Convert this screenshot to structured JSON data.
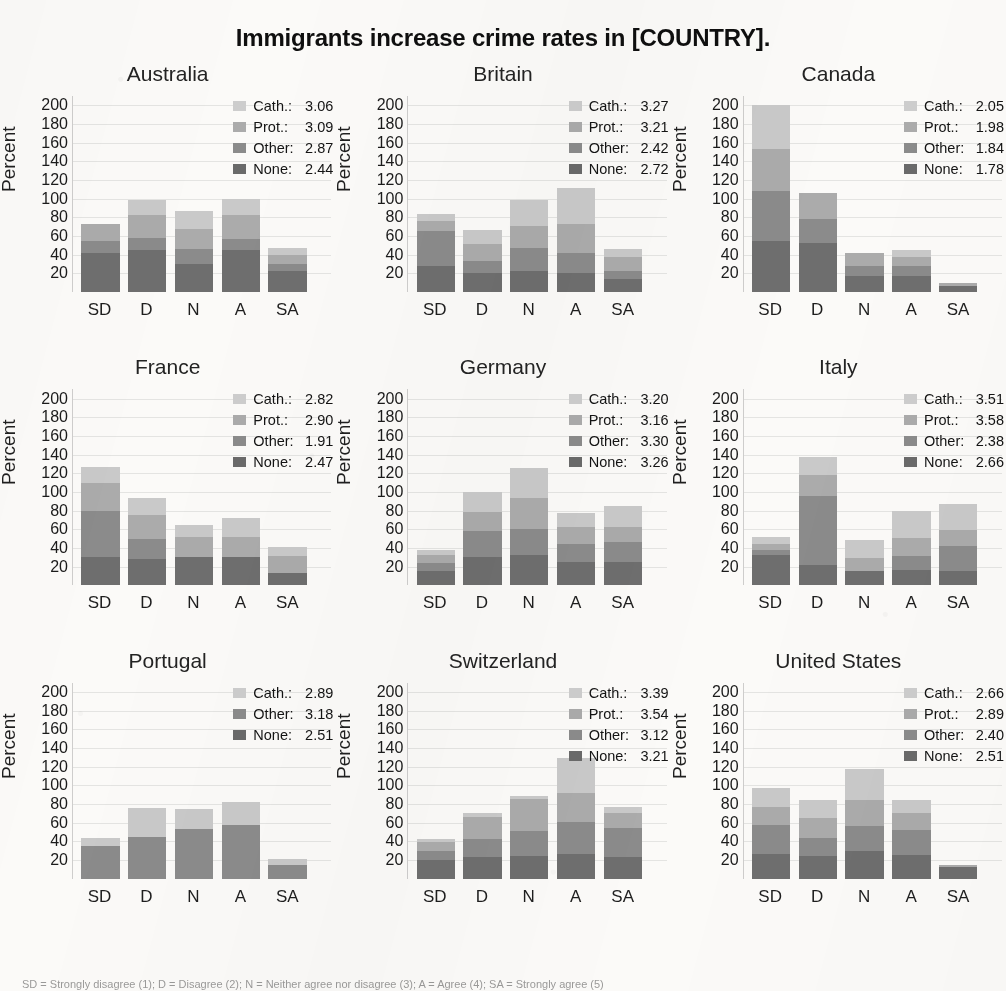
{
  "figure": {
    "title": "Immigrants increase crime rates in [COUNTRY].",
    "y_axis_label": "Percent",
    "caption": "SD = Strongly disagree (1); D = Disagree (2); N = Neither agree nor disagree (3); A = Agree (4); SA = Strongly agree (5)"
  },
  "series_labels": {
    "cath": "Cath.:",
    "prot": "Prot.:",
    "other": "Other:",
    "none": "None:"
  },
  "colors": {
    "cath": "#c9c9c9",
    "prot": "#ababab",
    "other": "#8b8b8b",
    "none": "#6e6e6e",
    "title": "#0f0f0f",
    "background": "#fbfaf8"
  },
  "chart_data": {
    "type": "bar",
    "subtype": "stacked-bar-small-multiples",
    "title": "Immigrants increase crime rates in [COUNTRY].",
    "xlabel": "",
    "ylabel": "Percent",
    "ylim": [
      0,
      210
    ],
    "yticks": [
      20,
      40,
      60,
      80,
      100,
      120,
      140,
      160,
      180,
      200
    ],
    "grid": true,
    "legend_position": "top-right inside each panel",
    "categories": [
      "SD",
      "D",
      "N",
      "A",
      "SA"
    ],
    "category_full": [
      "Strongly disagree",
      "Disagree",
      "Neither agree nor disagree",
      "Agree",
      "Strongly agree"
    ],
    "series_order": [
      "none",
      "other",
      "prot",
      "cath"
    ],
    "series_names": [
      "None",
      "Other",
      "Prot.",
      "Cath."
    ],
    "panels": [
      {
        "name": "Australia",
        "legend": [
          {
            "key": "cath",
            "label": "Cath.:",
            "value": "3.06"
          },
          {
            "key": "prot",
            "label": "Prot.:",
            "value": "3.09"
          },
          {
            "key": "other",
            "label": "Other:",
            "value": "2.87"
          },
          {
            "key": "none",
            "label": "None:",
            "value": "2.44"
          }
        ],
        "series": [
          {
            "name": "None",
            "key": "none",
            "values": [
              42,
              45,
              30,
              45,
              22
            ]
          },
          {
            "name": "Other",
            "key": "other",
            "values": [
              13,
              13,
              16,
              12,
              8
            ]
          },
          {
            "name": "Prot.",
            "key": "prot",
            "values": [
              18,
              25,
              22,
              26,
              10
            ]
          },
          {
            "name": "Cath.",
            "key": "cath",
            "values": [
              0,
              16,
              19,
              17,
              7
            ]
          }
        ],
        "totals": [
          73,
          99,
          87,
          100,
          47
        ]
      },
      {
        "name": "Britain",
        "legend": [
          {
            "key": "cath",
            "label": "Cath.:",
            "value": "3.27"
          },
          {
            "key": "prot",
            "label": "Prot.:",
            "value": "3.21"
          },
          {
            "key": "other",
            "label": "Other:",
            "value": "2.42"
          },
          {
            "key": "none",
            "label": "None:",
            "value": "2.72"
          }
        ],
        "series": [
          {
            "name": "None",
            "key": "none",
            "values": [
              28,
              20,
              22,
              20,
              14
            ]
          },
          {
            "name": "Other",
            "key": "other",
            "values": [
              37,
              13,
              25,
              22,
              8
            ]
          },
          {
            "name": "Prot.",
            "key": "prot",
            "values": [
              11,
              19,
              24,
              31,
              16
            ]
          },
          {
            "name": "Cath.",
            "key": "cath",
            "values": [
              8,
              14,
              28,
              39,
              8
            ]
          }
        ],
        "totals": [
          84,
          66,
          99,
          112,
          46
        ]
      },
      {
        "name": "Canada",
        "legend": [
          {
            "key": "cath",
            "label": "Cath.:",
            "value": "2.05"
          },
          {
            "key": "prot",
            "label": "Prot.:",
            "value": "1.98"
          },
          {
            "key": "other",
            "label": "Other:",
            "value": "1.84"
          },
          {
            "key": "none",
            "label": "None:",
            "value": "1.78"
          }
        ],
        "series": [
          {
            "name": "None",
            "key": "none",
            "values": [
              55,
              53,
              17,
              17,
              6
            ]
          },
          {
            "name": "Other",
            "key": "other",
            "values": [
              53,
              25,
              11,
              11,
              0
            ]
          },
          {
            "name": "Prot.",
            "key": "prot",
            "values": [
              45,
              28,
              14,
              9,
              4
            ]
          },
          {
            "name": "Cath.",
            "key": "cath",
            "values": [
              47,
              0,
              0,
              8,
              0
            ]
          }
        ],
        "totals": [
          200,
          106,
          42,
          45,
          10
        ]
      },
      {
        "name": "France",
        "legend": [
          {
            "key": "cath",
            "label": "Cath.:",
            "value": "2.82"
          },
          {
            "key": "prot",
            "label": "Prot.:",
            "value": "2.90"
          },
          {
            "key": "other",
            "label": "Other:",
            "value": "1.91"
          },
          {
            "key": "none",
            "label": "None:",
            "value": "2.47"
          }
        ],
        "series": [
          {
            "name": "None",
            "key": "none",
            "values": [
              30,
              28,
              30,
              30,
              13
            ]
          },
          {
            "name": "Other",
            "key": "other",
            "values": [
              50,
              22,
              0,
              0,
              0
            ]
          },
          {
            "name": "Prot.",
            "key": "prot",
            "values": [
              30,
              25,
              22,
              22,
              18
            ]
          },
          {
            "name": "Cath.",
            "key": "cath",
            "values": [
              17,
              19,
              13,
              20,
              10
            ]
          }
        ],
        "totals": [
          127,
          94,
          65,
          72,
          41
        ]
      },
      {
        "name": "Germany",
        "legend": [
          {
            "key": "cath",
            "label": "Cath.:",
            "value": "3.20"
          },
          {
            "key": "prot",
            "label": "Prot.:",
            "value": "3.16"
          },
          {
            "key": "other",
            "label": "Other:",
            "value": "3.30"
          },
          {
            "key": "none",
            "label": "None:",
            "value": "3.26"
          }
        ],
        "series": [
          {
            "name": "None",
            "key": "none",
            "values": [
              15,
              30,
              32,
              25,
              25
            ]
          },
          {
            "name": "Other",
            "key": "other",
            "values": [
              9,
              28,
              28,
              19,
              21
            ]
          },
          {
            "name": "Prot.",
            "key": "prot",
            "values": [
              8,
              21,
              34,
              18,
              17
            ]
          },
          {
            "name": "Cath.",
            "key": "cath",
            "values": [
              6,
              21,
              32,
              16,
              22
            ]
          }
        ],
        "totals": [
          38,
          100,
          126,
          78,
          85
        ]
      },
      {
        "name": "Italy",
        "legend": [
          {
            "key": "cath",
            "label": "Cath.:",
            "value": "3.51"
          },
          {
            "key": "prot",
            "label": "Prot.:",
            "value": "3.58"
          },
          {
            "key": "other",
            "label": "Other:",
            "value": "2.38"
          },
          {
            "key": "none",
            "label": "None:",
            "value": "2.66"
          }
        ],
        "series": [
          {
            "name": "None",
            "key": "none",
            "values": [
              33,
              22,
              15,
              16,
              15
            ]
          },
          {
            "name": "Other",
            "key": "other",
            "values": [
              5,
              74,
              0,
              15,
              27
            ]
          },
          {
            "name": "Prot.",
            "key": "prot",
            "values": [
              6,
              22,
              14,
              20,
              17
            ]
          },
          {
            "name": "Cath.",
            "key": "cath",
            "values": [
              8,
              19,
              20,
              29,
              28
            ]
          }
        ],
        "totals": [
          52,
          137,
          49,
          80,
          87
        ]
      },
      {
        "name": "Portugal",
        "legend": [
          {
            "key": "cath",
            "label": "Cath.:",
            "value": "2.89"
          },
          {
            "key": "other",
            "label": "Other:",
            "value": "3.18"
          },
          {
            "key": "none",
            "label": "None:",
            "value": "2.51"
          }
        ],
        "series": [
          {
            "name": "None",
            "key": "none",
            "values": [
              0,
              0,
              0,
              0,
              0
            ]
          },
          {
            "name": "Other",
            "key": "other",
            "values": [
              35,
              45,
              53,
              57,
              15
            ]
          },
          {
            "name": "Prot.",
            "key": "prot",
            "values": [
              0,
              0,
              0,
              0,
              0
            ]
          },
          {
            "name": "Cath.",
            "key": "cath",
            "values": [
              9,
              31,
              22,
              25,
              6
            ]
          }
        ],
        "totals": [
          44,
          76,
          75,
          82,
          21
        ]
      },
      {
        "name": "Switzerland",
        "legend": [
          {
            "key": "cath",
            "label": "Cath.:",
            "value": "3.39"
          },
          {
            "key": "prot",
            "label": "Prot.:",
            "value": "3.54"
          },
          {
            "key": "other",
            "label": "Other:",
            "value": "3.12"
          },
          {
            "key": "none",
            "label": "None:",
            "value": "3.21"
          }
        ],
        "series": [
          {
            "name": "None",
            "key": "none",
            "values": [
              20,
              23,
              24,
              26,
              23
            ]
          },
          {
            "name": "Other",
            "key": "other",
            "values": [
              10,
              20,
              27,
              35,
              31
            ]
          },
          {
            "name": "Prot.",
            "key": "prot",
            "values": [
              9,
              23,
              34,
              31,
              16
            ]
          },
          {
            "name": "Cath.",
            "key": "cath",
            "values": [
              3,
              4,
              4,
              37,
              7
            ]
          }
        ],
        "totals": [
          42,
          70,
          89,
          129,
          77
        ]
      },
      {
        "name": "United States",
        "legend": [
          {
            "key": "cath",
            "label": "Cath.:",
            "value": "2.66"
          },
          {
            "key": "prot",
            "label": "Prot.:",
            "value": "2.89"
          },
          {
            "key": "other",
            "label": "Other:",
            "value": "2.40"
          },
          {
            "key": "none",
            "label": "None:",
            "value": "2.51"
          }
        ],
        "series": [
          {
            "name": "None",
            "key": "none",
            "values": [
              26,
              24,
              30,
              25,
              13
            ]
          },
          {
            "name": "Other",
            "key": "other",
            "values": [
              32,
              20,
              26,
              27,
              0
            ]
          },
          {
            "name": "Prot.",
            "key": "prot",
            "values": [
              19,
              21,
              28,
              18,
              2
            ]
          },
          {
            "name": "Cath.",
            "key": "cath",
            "values": [
              20,
              19,
              33,
              14,
              0
            ]
          }
        ],
        "totals": [
          97,
          84,
          117,
          84,
          15
        ]
      }
    ]
  }
}
